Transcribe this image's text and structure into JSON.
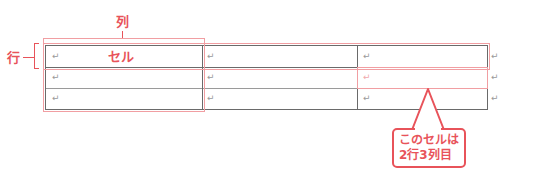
{
  "labels": {
    "column": "列",
    "row": "行"
  },
  "table": {
    "rows": [
      [
        "↵ セル",
        "↵",
        "↵"
      ],
      [
        "↵",
        "↵",
        "↵"
      ],
      [
        "↵",
        "↵",
        "↵"
      ]
    ],
    "cell_label": "セル",
    "paragraph_mark": "↵",
    "row_end_mark": "↵"
  },
  "callout": {
    "line1": "このセルは",
    "line2": "2行3列目"
  },
  "colors": {
    "accent": "#e8535a",
    "highlight": "#f19ea2",
    "grid": "#6a6a6a"
  }
}
